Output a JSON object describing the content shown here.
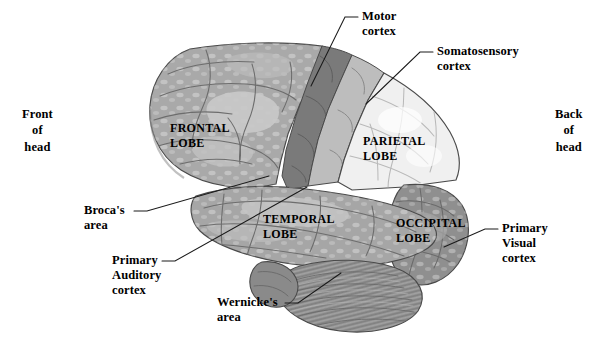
{
  "figure": {
    "background_color": "#ffffff",
    "width": 602,
    "height": 345
  },
  "orientation_labels": [
    {
      "id": "front",
      "text": "Front\nof\nhead",
      "x": 22,
      "y": 106
    },
    {
      "id": "back",
      "text": "Back\nof\nhead",
      "x": 555,
      "y": 106
    }
  ],
  "lobe_labels": [
    {
      "id": "frontal",
      "text": "FRONTAL\nLOBE",
      "x": 170,
      "y": 121,
      "fill": "#a9a9a9"
    },
    {
      "id": "parietal",
      "text": "PARIETAL\nLOBE",
      "x": 363,
      "y": 134,
      "fill": "#f0f0f0"
    },
    {
      "id": "temporal",
      "text": "TEMPORAL\nLOBE",
      "x": 263,
      "y": 212,
      "fill": "#a6a6a6"
    },
    {
      "id": "occipital",
      "text": "OCCIPITAL\nLOBE",
      "x": 396,
      "y": 216,
      "fill": "#8f8f8f"
    }
  ],
  "callouts": [
    {
      "id": "motor-cortex",
      "text": "Motor\ncortex",
      "label_x": 362,
      "label_y": 9,
      "align": "left",
      "leader": "M 358 17 L 345 17 L 311 86",
      "tick": true
    },
    {
      "id": "somatosensory-cortex",
      "text": "Somatosensory\ncortex",
      "label_x": 437,
      "label_y": 44,
      "align": "left",
      "leader": "M 433 52 L 420 52 L 366 104",
      "tick": true
    },
    {
      "id": "brocas-area",
      "text": "Broca's\narea",
      "label_x": 84,
      "label_y": 203,
      "align": "left",
      "leader": "M 134 211 L 147 211 L 269 176",
      "tick": true
    },
    {
      "id": "primary-auditory-cortex",
      "text": "Primary\nAuditory\ncortex",
      "label_x": 112,
      "label_y": 253,
      "align": "left",
      "leader": "M 162 261 L 175 261 L 307 187",
      "tick": true
    },
    {
      "id": "wernickes-area",
      "text": "Wernicke's\narea",
      "label_x": 217,
      "label_y": 295,
      "align": "left",
      "leader": "M 285 303 L 298 303 L 341 273",
      "tick": true
    },
    {
      "id": "primary-visual-cortex",
      "text": "Primary\nVisual\ncortex",
      "label_x": 502,
      "label_y": 221,
      "align": "left",
      "leader": "M 498 229 L 485 229 L 444 247",
      "tick": true
    }
  ],
  "palette": {
    "outline": "#4a4a4a",
    "frontal_lobe": "#a9a9a9",
    "frontal_highlight": "#c6c6c6",
    "parietal_lobe": "#f0f0f0",
    "temporal_lobe": "#a6a6a6",
    "occipital_lobe": "#8f8f8f",
    "motor_cortex": "#7a7a7a",
    "somatosensory_cortex": "#bdbdbd",
    "cerebellum": "#949494",
    "brainstem": "#8a8a8a",
    "sulci": "#6d6d6d",
    "leader_line": "#1a1a1a"
  }
}
